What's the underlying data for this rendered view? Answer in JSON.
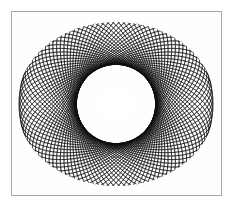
{
  "page": {
    "title": "Spirograph Moire Figure",
    "background_color": "#ffffff",
    "width": 252,
    "height": 214
  },
  "frame": {
    "name": "plate-frame",
    "border_color": "#a8a8a8",
    "border_width": 1,
    "fill_color": "#fefefe",
    "left": 11,
    "top": 11,
    "width": 211,
    "height": 185
  },
  "figure": {
    "kind": "spirograph-moire-rosette",
    "stroke_color": "#101010",
    "background_color": "#ffffff",
    "center_x": 116,
    "center_y": 104,
    "bounds": {
      "left": 22,
      "top": 22,
      "right": 222,
      "bottom": 188
    },
    "symmetry": "4-fold",
    "outer_lobes": 4,
    "inner_lobes": 4,
    "center_void": {
      "name": "center-squircle-void",
      "shape": "squircle",
      "fill_color": "#ffffff",
      "width": 40,
      "height": 36
    },
    "chart_data": {
      "type": "line",
      "title": "Spirograph Moire Figure",
      "xlabel": "",
      "ylabel": "",
      "grid": false,
      "legend": "none",
      "xlim": [
        -100,
        100
      ],
      "ylim": [
        -83,
        83
      ],
      "generator": "ellipse-family-rotation",
      "ellipse_semi_major": 98,
      "ellipse_semi_minor": 40,
      "ellipse_count": 96,
      "rotation_start_deg": 0,
      "rotation_step_deg": 3.75,
      "stroke_width": 0.5,
      "series": [
        {
          "name": "ellipse-family-a",
          "rotation_offset_deg": 0,
          "count": 48
        },
        {
          "name": "ellipse-family-b",
          "rotation_offset_deg": 90,
          "count": 48
        }
      ]
    }
  },
  "annotations": {
    "caption": "",
    "labels": []
  }
}
